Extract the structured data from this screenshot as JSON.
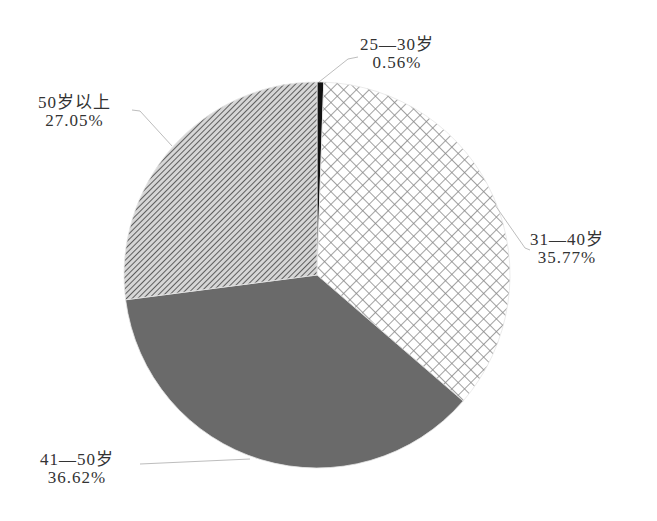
{
  "chart_data": {
    "type": "pie",
    "title": "",
    "categories": [
      "25—30岁",
      "31—40岁",
      "41—50岁",
      "50岁以上"
    ],
    "values": [
      0.56,
      35.77,
      36.62,
      27.05
    ],
    "unit": "%",
    "start_angle_deg": 0,
    "direction": "clockwise",
    "legend": "none (data labels with leader lines)",
    "slices": [
      {
        "label": "25—30岁",
        "value": 0.56,
        "display": "0.56%",
        "fill": "solid",
        "color": "#111111"
      },
      {
        "label": "31—40岁",
        "value": 35.77,
        "display": "35.77%",
        "fill": "crosshatch",
        "color": "#8a8a8a"
      },
      {
        "label": "41—50岁",
        "value": 36.62,
        "display": "36.62%",
        "fill": "solid",
        "color": "#6a6a6a"
      },
      {
        "label": "50岁以上",
        "value": 27.05,
        "display": "27.05%",
        "fill": "diagonal-stripes",
        "color": "#7a7a7a"
      }
    ]
  },
  "labels": {
    "s0": {
      "name": "25—30岁",
      "pct": "0.56%"
    },
    "s1": {
      "name": "31—40岁",
      "pct": "35.77%"
    },
    "s2": {
      "name": "41—50岁",
      "pct": "36.62%"
    },
    "s3": {
      "name": "50岁以上",
      "pct": "27.05%"
    }
  }
}
